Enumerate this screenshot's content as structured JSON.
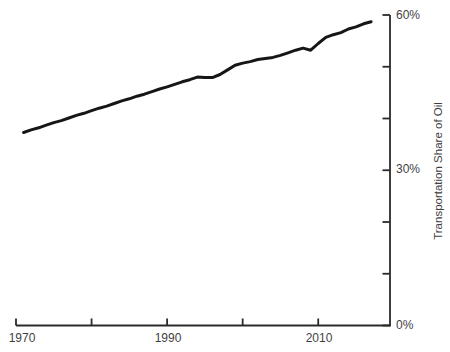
{
  "chart_data": {
    "type": "line",
    "title": "",
    "xlabel": "",
    "ylabel": "Transportation Share of Oil",
    "xlim": [
      1970,
      2019.5
    ],
    "ylim": [
      0,
      60
    ],
    "grid": false,
    "legend": "none",
    "y_axis_side": "right",
    "line_color": "#161616",
    "line_width": 3,
    "axis_color": "#2a2a2a",
    "label_color": "#3f3f3f",
    "x_ticks": [
      {
        "value": 1970,
        "label": "1970"
      },
      {
        "value": 1980,
        "label": ""
      },
      {
        "value": 1990,
        "label": "1990"
      },
      {
        "value": 2000,
        "label": ""
      },
      {
        "value": 2010,
        "label": "2010"
      }
    ],
    "y_ticks": [
      {
        "value": 0,
        "label": "0%"
      },
      {
        "value": 10,
        "label": ""
      },
      {
        "value": 20,
        "label": ""
      },
      {
        "value": 30,
        "label": "30%"
      },
      {
        "value": 40,
        "label": ""
      },
      {
        "value": 50,
        "label": ""
      },
      {
        "value": 60,
        "label": "60%"
      }
    ],
    "series": [
      {
        "name": "Transportation Share of Oil",
        "x": [
          1971,
          1972,
          1973,
          1974,
          1975,
          1976,
          1977,
          1978,
          1979,
          1980,
          1981,
          1982,
          1983,
          1984,
          1985,
          1986,
          1987,
          1988,
          1989,
          1990,
          1991,
          1992,
          1993,
          1994,
          1995,
          1996,
          1997,
          1998,
          1999,
          2000,
          2001,
          2002,
          2003,
          2004,
          2005,
          2006,
          2007,
          2008,
          2009,
          2010,
          2011,
          2012,
          2013,
          2014,
          2015,
          2016,
          2017
        ],
        "values": [
          37.3,
          37.8,
          38.2,
          38.7,
          39.2,
          39.6,
          40.1,
          40.6,
          41.0,
          41.5,
          42.0,
          42.4,
          42.9,
          43.4,
          43.8,
          44.3,
          44.7,
          45.2,
          45.7,
          46.1,
          46.6,
          47.1,
          47.5,
          48.0,
          47.9,
          47.9,
          48.5,
          49.4,
          50.3,
          50.7,
          51.0,
          51.4,
          51.6,
          51.8,
          52.2,
          52.7,
          53.2,
          53.6,
          53.2,
          54.5,
          55.7,
          56.2,
          56.6,
          57.3,
          57.7,
          58.3,
          58.7
        ]
      }
    ]
  }
}
